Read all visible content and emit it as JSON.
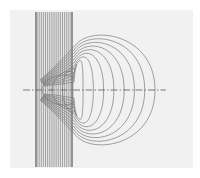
{
  "figure": {
    "colors": {
      "background": "#ffffff",
      "panel": "#f1f1f1",
      "band_line": "#6a6a6a",
      "curve": "#7a7a7a",
      "axis": "#5a5a5a"
    },
    "band_line_count": 20,
    "loop_count": 12,
    "axis_style": "dash-dot"
  }
}
